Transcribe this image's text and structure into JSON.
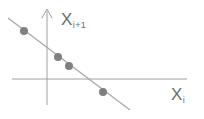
{
  "figure": {
    "title": "",
    "background_color": "#ffffff"
  },
  "axes": {
    "y_axis": {
      "label_base": "X",
      "label_sub": "i+1",
      "has_arrow": true,
      "color": "#9a9a9a"
    },
    "x_axis": {
      "label_base": "X",
      "label_sub": "i",
      "has_arrow": false,
      "color": "#9a9a9a"
    }
  },
  "chart_data": {
    "type": "scatter",
    "title": "",
    "xlabel": "X_i",
    "ylabel": "X_i+1",
    "grid": false,
    "legend": null,
    "xlim": [
      -1.6,
      3.4
    ],
    "ylim": [
      -1.0,
      2.2
    ],
    "origin_px": {
      "x": 47,
      "y": 79
    },
    "point_color": "#808080",
    "line_color": "#a8a8a8",
    "points": [
      {
        "x": -0.72,
        "y": 1.28,
        "px": 24,
        "py": 31
      },
      {
        "x": 0.27,
        "y": 0.63,
        "px": 58,
        "py": 57
      },
      {
        "x": 0.58,
        "y": 0.37,
        "px": 69,
        "py": 66
      },
      {
        "x": 1.55,
        "y": -0.35,
        "px": 103,
        "py": 92
      }
    ],
    "fit_line": {
      "description": "negative-slope regression line through the points",
      "start": {
        "x": -1.16,
        "y": 1.63,
        "px": 8,
        "py": 18
      },
      "end": {
        "x": 2.35,
        "y": -0.87,
        "px": 130,
        "py": 110
      },
      "slope": -0.713,
      "intercept": 0.807
    }
  }
}
